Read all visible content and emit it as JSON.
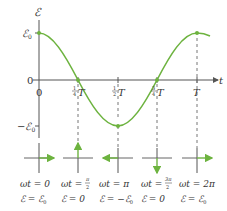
{
  "diagram": {
    "title": "",
    "y_axis_label": "ℰ",
    "x_axis_label": "t",
    "y_ticks": {
      "max": "ℰ",
      "max_sub": "0",
      "zero": "0",
      "min": "−ℰ",
      "min_sub": "0"
    },
    "x_ticks": [
      {
        "frac": "",
        "num": "0",
        "suffix": ""
      },
      {
        "frac_num": "1",
        "frac_den": "4",
        "suffix": "T"
      },
      {
        "frac_num": "1",
        "frac_den": "2",
        "suffix": "T"
      },
      {
        "frac_num": "3",
        "frac_den": "4",
        "suffix": "T"
      },
      {
        "suffix": "T"
      }
    ],
    "curve": {
      "function": "ℰ = ℰ0 cos(ωt)",
      "color": "#6db33f"
    },
    "phasors": [
      {
        "phase_label": "ωt = 0",
        "emf_label": "ℰ = ℰ",
        "emf_sub": "0",
        "direction": "right"
      },
      {
        "phase_label": "ωt = ",
        "phase_frac_num": "π",
        "phase_frac_den": "2",
        "emf_label": "ℰ = 0",
        "direction": "up"
      },
      {
        "phase_label": "ωt = π",
        "emf_label": "ℰ = −ℰ",
        "emf_sub": "0",
        "direction": "left"
      },
      {
        "phase_label": "ωt = ",
        "phase_frac_num": "3π",
        "phase_frac_den": "2",
        "emf_label": "ℰ = 0",
        "direction": "down"
      },
      {
        "phase_label": "ωt = 2π",
        "emf_label": "ℰ = ℰ",
        "emf_sub": "0",
        "direction": "right"
      }
    ],
    "colors": {
      "axis": "#555555",
      "dashed": "#777777",
      "curve": "#6db33f",
      "phasor_cross": "#666666"
    }
  }
}
